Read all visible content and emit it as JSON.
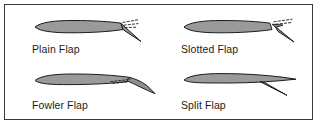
{
  "figure": {
    "frame": {
      "border_color": "#3a3a3a",
      "background": "#ffffff"
    },
    "style": {
      "airfoil_fill": "#9a9a9a",
      "airfoil_stroke": "#1c1c1c",
      "flap_fill": "#8f8f8f",
      "slot_line_color": "#1c1c1c",
      "text_color": "#1c1c1c"
    },
    "panels": [
      {
        "id": "plain-flap",
        "label": "Plain Flap",
        "description": "Airfoil cross-section with trailing-edge flap hinged downward; dashed slot marks at the hinge line",
        "flap_deflection_deg": 35,
        "has_slot": false,
        "has_dashed_marks": true
      },
      {
        "id": "slotted-flap",
        "label": "Slotted Flap",
        "description": "Airfoil cross-section with trailing-edge flap deflected downward leaving an open slot between wing and flap",
        "flap_deflection_deg": 38,
        "has_slot": true,
        "has_dashed_marks": true
      },
      {
        "id": "fowler-flap",
        "label": "Fowler Flap",
        "description": "Airfoil cross-section with flap translated aft and downward from the trailing edge, opening a slot",
        "flap_deflection_deg": 28,
        "has_slot": true,
        "has_dashed_marks": true
      },
      {
        "id": "split-flap",
        "label": "Split Flap",
        "description": "Airfoil cross-section with lower surface panel hinged downward while the upper surface remains undeflected",
        "flap_deflection_deg": 40,
        "has_slot": false,
        "has_dashed_marks": false
      }
    ]
  }
}
